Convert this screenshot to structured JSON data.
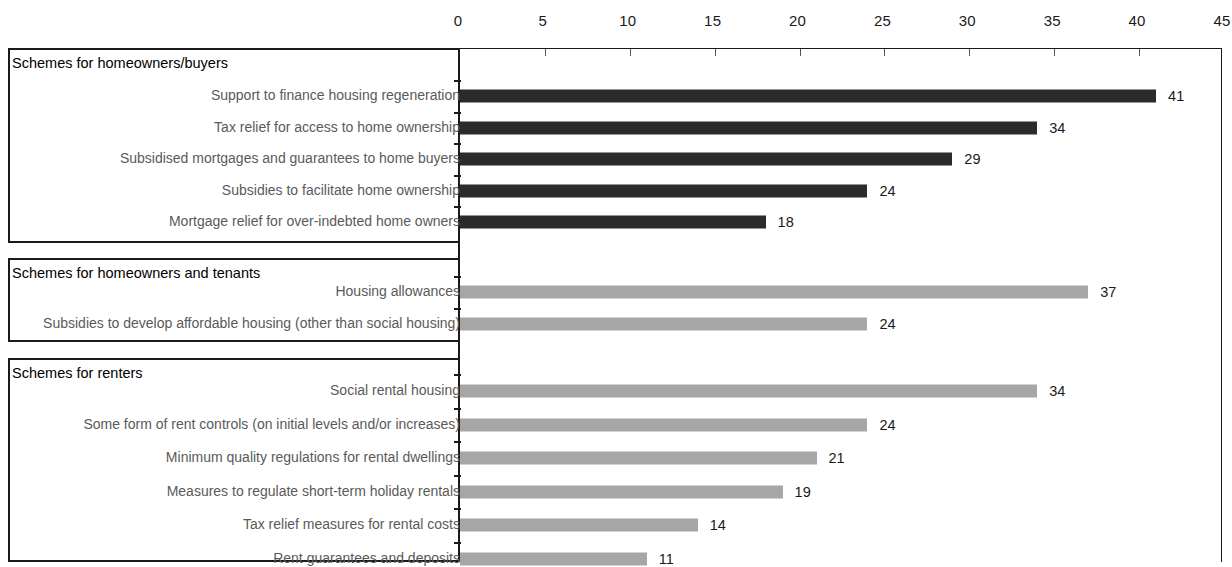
{
  "chart_data": {
    "type": "bar",
    "orientation": "horizontal",
    "title": "",
    "xlabel": "",
    "ylabel": "",
    "xlim": [
      0,
      45
    ],
    "xticks": [
      0,
      5,
      10,
      15,
      20,
      25,
      30,
      35,
      40,
      45
    ],
    "grid": false,
    "legend": "none",
    "value_labels": true,
    "colors": {
      "homeowners_buyers": "#2b2b2b",
      "homeowners_tenants": "#a6a6a6",
      "renters": "#a6a6a6",
      "axis": "#1a1a1a",
      "category_label": "#5a5a5a",
      "group_title": "#000000"
    },
    "groups": [
      {
        "title": "Schemes for homeowners/buyers",
        "color_key": "homeowners_buyers",
        "categories": [
          "Support to finance housing regeneration",
          "Tax relief for access to home ownership",
          "Subsidised mortgages and guarantees to home buyers",
          "Subsidies to facilitate home ownership",
          "Mortgage relief for over-indebted home owners"
        ],
        "values": [
          41,
          34,
          29,
          24,
          18
        ]
      },
      {
        "title": "Schemes for homeowners and tenants",
        "color_key": "homeowners_tenants",
        "categories": [
          "Housing allowances",
          "Subsidies to develop affordable housing (other than social housing)"
        ],
        "values": [
          37,
          24
        ]
      },
      {
        "title": "Schemes for renters",
        "color_key": "renters",
        "categories": [
          "Social rental housing",
          "Some form of rent controls (on initial levels and/or increases)",
          "Minimum  quality regulations for rental dwellings",
          "Measures to regulate short-term holiday rentals",
          "Tax relief measures for rental costs",
          "Rent guarantees and deposits"
        ],
        "values": [
          34,
          24,
          21,
          19,
          14,
          11
        ]
      }
    ]
  },
  "axis": {
    "ticks": [
      "0",
      "5",
      "10",
      "15",
      "20",
      "25",
      "30",
      "35",
      "40",
      "45"
    ]
  }
}
